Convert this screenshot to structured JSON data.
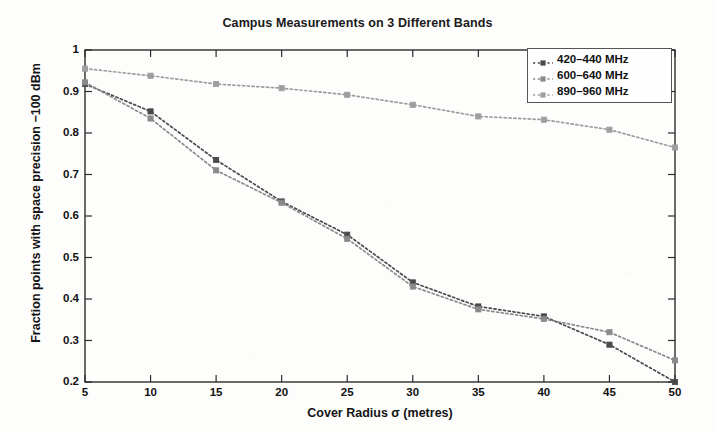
{
  "chart_data": {
    "type": "line",
    "title": "Campus Measurements on 3 Different Bands",
    "xlabel": "Cover Radius σ (metres)",
    "ylabel": "Fraction points with space precision −100 dBm",
    "x": [
      5,
      10,
      15,
      20,
      25,
      30,
      35,
      40,
      45,
      50
    ],
    "xlim": [
      5,
      50
    ],
    "ylim": [
      0.2,
      1
    ],
    "xticks": [
      "5",
      "10",
      "15",
      "20",
      "25",
      "30",
      "35",
      "40",
      "45",
      "50"
    ],
    "yticks": [
      "0.2",
      "0.3",
      "0.4",
      "0.5",
      "0.6",
      "0.7",
      "0.8",
      "0.9",
      "1"
    ],
    "grid": false,
    "legend_position": "top-right",
    "marker": "square",
    "linestyle": "dotted",
    "series": [
      {
        "name": "420–440 MHz",
        "color": "#4a4a4a",
        "values": [
          0.918,
          0.852,
          0.735,
          0.635,
          0.555,
          0.44,
          0.382,
          0.358,
          0.29,
          0.2
        ]
      },
      {
        "name": "600–640 MHz",
        "color": "#8a8a8a",
        "values": [
          0.922,
          0.835,
          0.71,
          0.632,
          0.545,
          0.43,
          0.375,
          0.352,
          0.32,
          0.252
        ]
      },
      {
        "name": "890–960 MHz",
        "color": "#9e9e9e",
        "values": [
          0.955,
          0.938,
          0.918,
          0.908,
          0.892,
          0.868,
          0.84,
          0.832,
          0.808,
          0.765
        ]
      }
    ]
  },
  "chart": {
    "title": "Campus Measurements on 3 Different Bands",
    "xlabel": "Cover Radius σ (metres)",
    "ylabel": "Fraction points with space precision −100 dBm"
  },
  "legend": {
    "items": [
      {
        "label": "420–440 MHz"
      },
      {
        "label": "600–640 MHz"
      },
      {
        "label": "890–960 MHz"
      }
    ]
  },
  "axes": {
    "yticks": [
      {
        "label": "1"
      },
      {
        "label": "0.9"
      },
      {
        "label": "0.8"
      },
      {
        "label": "0.7"
      },
      {
        "label": "0.6"
      },
      {
        "label": "0.5"
      },
      {
        "label": "0.4"
      },
      {
        "label": "0.3"
      },
      {
        "label": "0.2"
      }
    ],
    "xticks": [
      {
        "label": "5"
      },
      {
        "label": "10"
      },
      {
        "label": "15"
      },
      {
        "label": "20"
      },
      {
        "label": "25"
      },
      {
        "label": "30"
      },
      {
        "label": "35"
      },
      {
        "label": "40"
      },
      {
        "label": "45"
      },
      {
        "label": "50"
      }
    ]
  }
}
